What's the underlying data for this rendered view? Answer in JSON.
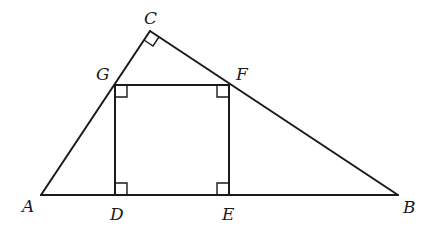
{
  "figure": {
    "type": "geometry",
    "points": {
      "A": {
        "label": "A",
        "x": 41,
        "y": 195,
        "label_x": 22,
        "label_y": 212
      },
      "B": {
        "label": "B",
        "x": 398,
        "y": 195,
        "label_x": 403,
        "label_y": 213
      },
      "C": {
        "label": "C",
        "x": 150,
        "y": 31,
        "label_x": 144,
        "label_y": 24
      },
      "D": {
        "label": "D",
        "x": 116,
        "y": 195,
        "label_x": 110,
        "label_y": 220
      },
      "E": {
        "label": "E",
        "x": 229,
        "y": 195,
        "label_x": 222,
        "label_y": 220
      },
      "F": {
        "label": "F",
        "x": 229,
        "y": 85,
        "label_x": 236,
        "label_y": 80
      },
      "G": {
        "label": "G",
        "x": 115,
        "y": 85,
        "label_x": 96,
        "label_y": 80
      }
    },
    "segments": [
      "AB",
      "AC",
      "CB",
      "GF",
      "GD",
      "FE"
    ],
    "right_angles": [
      "C",
      "G",
      "F",
      "D",
      "E"
    ]
  }
}
